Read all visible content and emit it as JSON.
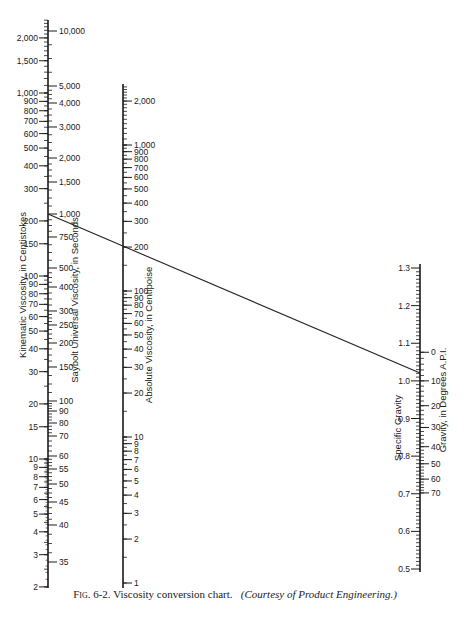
{
  "chart_data": {
    "type": "nomogram",
    "title": "Viscosity conversion chart",
    "caption": {
      "figure": "Fig. 6-2.",
      "text": "Viscosity conversion chart.",
      "credit": "(Courtesy of Product Engineering.)"
    },
    "scales": [
      {
        "id": "kinematic",
        "label": "Kinematic Viscosity, in Centistokes",
        "side": "left",
        "type": "log",
        "ticks": [
          "2,000",
          "1,500",
          "1,000",
          "900",
          "800",
          "700",
          "600",
          "500",
          "400",
          "300",
          "200",
          "150",
          "100",
          "90",
          "80",
          "70",
          "60",
          "50",
          "40",
          "30",
          "20",
          "15",
          "10",
          "9",
          "8",
          "7",
          "6",
          "5",
          "4",
          "3",
          "2"
        ],
        "range": [
          2,
          2500
        ]
      },
      {
        "id": "saybolt",
        "label": "Saybolt Universal Viscosity, in Seconds",
        "side": "right",
        "type": "log",
        "ticks": [
          "10,000",
          "5,000",
          "4,000",
          "3,000",
          "2,000",
          "1,500",
          "1,000",
          "750",
          "500",
          "400",
          "300",
          "250",
          "200",
          "150",
          "100",
          "90",
          "80",
          "70",
          "60",
          "55",
          "50",
          "45",
          "40",
          "35"
        ],
        "range": [
          35,
          10000
        ]
      },
      {
        "id": "absolute",
        "label": "Absolute Viscosity, in Centipoise",
        "type": "log",
        "ticks": [
          "2,000",
          "1,000",
          "900",
          "800",
          "700",
          "600",
          "500",
          "400",
          "300",
          "200",
          "100",
          "90",
          "80",
          "70",
          "60",
          "50",
          "40",
          "30",
          "20",
          "10",
          "9",
          "8",
          "7",
          "6",
          "5",
          "4",
          "3",
          "2",
          "1"
        ],
        "range": [
          1,
          2500
        ]
      },
      {
        "id": "specific_gravity",
        "label": "Specific Gravity",
        "side": "left",
        "type": "linear",
        "ticks": [
          "1.3",
          "1.2",
          "1.1",
          "1.0",
          "0.9",
          "0.8",
          "0.7",
          "0.6",
          "0.5"
        ],
        "range": [
          0.5,
          1.3
        ]
      },
      {
        "id": "api",
        "label": "Gravity, in Degrees A.P.I.",
        "side": "right",
        "type": "nonlinear",
        "ticks": [
          "0",
          "10",
          "20",
          "30",
          "40",
          "50",
          "60",
          "70"
        ],
        "range": [
          0,
          70
        ]
      }
    ],
    "example_line": {
      "kinematic_cs": 220,
      "saybolt_s": 1000,
      "absolute_cp": 200,
      "specific_gravity": 0.92,
      "api_deg": 22
    }
  }
}
